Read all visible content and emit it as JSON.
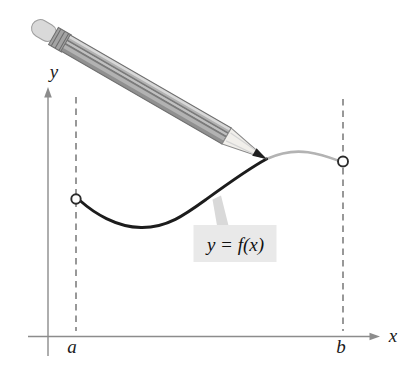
{
  "labels": {
    "y_axis": "y",
    "x_axis": "x",
    "interval_left": "a",
    "interval_right": "b",
    "curve": "y = f(x)"
  },
  "colors": {
    "background": "#ffffff",
    "axis": "#8c8c8c",
    "dashed_guide": "#7f7f7f",
    "curve_drawn": "#1c1c1c",
    "curve_pending": "#b3b3b3",
    "curve_label_box": "#e9e9e9",
    "endpoint_stroke": "#2b2b2b",
    "pencil_body": "#b2b2b2",
    "pencil_stripe": "#7a7a7a",
    "pencil_wood": "#f1efeb",
    "pencil_graphite": "#1f1f1f",
    "pencil_eraser": "#d9d9d9",
    "pencil_ferrule": "#a3a3a3"
  },
  "icons": {
    "pencil": "pencil-icon",
    "endpoint_left": "open-circle-icon",
    "endpoint_right": "open-circle-icon",
    "y_axis_arrow": "arrow-up-icon",
    "x_axis_arrow": "arrow-right-icon"
  }
}
